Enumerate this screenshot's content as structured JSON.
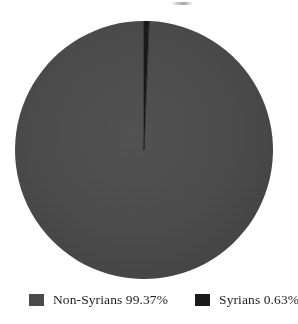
{
  "chart_data": {
    "type": "pie",
    "title": "",
    "categories": [
      "Non-Syrians",
      "Syrians"
    ],
    "values": [
      99.37,
      0.63
    ],
    "value_unit": "%",
    "labels": [
      "Non-Syrians 99.37%",
      "Syrians 0.63%"
    ],
    "colors": [
      "#4a4a4a",
      "#1a1a1a"
    ],
    "start_angle_deg": 0,
    "direction": "clockwise",
    "legend_position": "bottom",
    "grid": false,
    "slices": [
      {
        "name": "Non-Syrians",
        "value": 99.37,
        "value_text": "99.37%",
        "legend_text": "Non-Syrians 99.37%",
        "color": "#4a4a4a",
        "angle_deg": 357.73
      },
      {
        "name": "Syrians",
        "value": 0.63,
        "value_text": "0.63%",
        "legend_text": "Syrians 0.63%",
        "color": "#1a1a1a",
        "angle_deg": 2.27
      }
    ]
  },
  "legend": {
    "entries": [
      {
        "label": "Non-Syrians 99.37%",
        "color": "#4a4a4a",
        "swatch_name": "legend-swatch-non-syrians"
      },
      {
        "label": "Syrians 0.63%",
        "color": "#1a1a1a",
        "swatch_name": "legend-swatch-syrians"
      }
    ]
  },
  "background_color": "#ffffff"
}
